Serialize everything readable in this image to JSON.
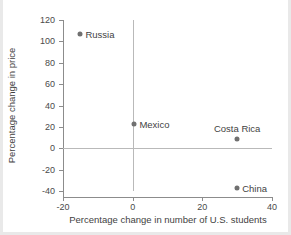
{
  "chart_data": {
    "type": "scatter",
    "title": "",
    "xlabel": "Percentage change in number of U.S. students",
    "ylabel": "Percentage change in price",
    "xlim": [
      -20,
      40
    ],
    "ylim": [
      -40,
      120
    ],
    "xticks": [
      "-20",
      "0",
      "20",
      "40"
    ],
    "xtick_values": [
      -20,
      0,
      20,
      40
    ],
    "yticks": [
      "120",
      "100",
      "80",
      "60",
      "40",
      "20",
      "0",
      "-20",
      "-40"
    ],
    "ytick_values": [
      120,
      100,
      80,
      60,
      40,
      20,
      0,
      -20,
      -40
    ],
    "grid": false,
    "legend": "none",
    "reference_lines": [
      {
        "axis": "y",
        "value": 0,
        "color": "#b9b9b9"
      },
      {
        "axis": "x",
        "value": 0,
        "color": "#b9b9b9"
      }
    ],
    "marker_color": "#707070",
    "points": [
      {
        "label": "Russia",
        "x": -15,
        "y": 107,
        "label_position": "right"
      },
      {
        "label": "Mexico",
        "x": 0.5,
        "y": 23,
        "label_position": "right"
      },
      {
        "label": "Costa Rica",
        "x": 30,
        "y": 9,
        "label_position": "above"
      },
      {
        "label": "China",
        "x": 30,
        "y": -37,
        "label_position": "right"
      }
    ]
  }
}
